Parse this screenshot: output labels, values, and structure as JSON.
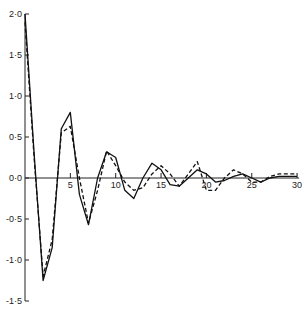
{
  "chart_data": {
    "type": "line",
    "title": "",
    "xlabel": "",
    "ylabel": "",
    "xlim": [
      0,
      30
    ],
    "ylim": [
      -1.5,
      2.0
    ],
    "grid": false,
    "legend": null,
    "x_ticks": [
      5,
      10,
      15,
      20,
      25,
      30
    ],
    "x_tick_labels": [
      "5",
      "10",
      "15",
      "20",
      "25",
      "30"
    ],
    "y_ticks": [
      2.0,
      1.5,
      1.0,
      0.5,
      0.0,
      -0.5,
      -1.0,
      -1.5
    ],
    "y_tick_labels": [
      "2·0",
      "1·5",
      "1·0",
      "0·5",
      "0·0",
      "-0·5",
      "-1·0",
      "-1·5"
    ],
    "x": [
      0,
      1,
      2,
      3,
      4,
      5,
      6,
      7,
      8,
      9,
      10,
      11,
      12,
      13,
      14,
      15,
      16,
      17,
      18,
      19,
      20,
      21,
      22,
      23,
      24,
      25,
      26,
      27,
      28,
      29,
      30
    ],
    "series": [
      {
        "name": "solid",
        "style": "solid",
        "values": [
          2.0,
          0.3,
          -1.25,
          -0.85,
          0.6,
          0.8,
          -0.2,
          -0.57,
          0.0,
          0.32,
          0.25,
          -0.15,
          -0.25,
          0.0,
          0.18,
          0.1,
          -0.08,
          -0.1,
          0.0,
          0.1,
          0.05,
          -0.05,
          -0.03,
          0.02,
          0.05,
          0.0,
          -0.05,
          0.0,
          0.02,
          0.02,
          0.02
        ]
      },
      {
        "name": "dashed",
        "style": "dashed",
        "values": [
          1.9,
          0.25,
          -1.2,
          -0.75,
          0.55,
          0.63,
          0.0,
          -0.55,
          -0.15,
          0.33,
          0.15,
          -0.05,
          -0.15,
          -0.12,
          0.05,
          0.15,
          0.05,
          -0.1,
          0.05,
          0.2,
          -0.15,
          -0.15,
          0.0,
          0.1,
          0.05,
          -0.05,
          -0.05,
          0.02,
          0.05,
          0.05,
          0.05
        ]
      }
    ]
  }
}
